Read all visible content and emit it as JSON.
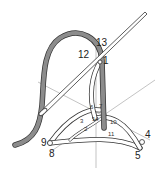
{
  "diagram": {
    "colors": {
      "thread": "#8c8c8c",
      "outline": "#333333",
      "guide_lines": "#9a9a9a",
      "background": "#ffffff"
    },
    "labels": {
      "l1": "1",
      "l2": "2",
      "l3": "3",
      "l4": "4",
      "l5": "5",
      "l6": "6",
      "l7": "7",
      "l8": "8",
      "l9": "9",
      "l10": "10",
      "l11": "11",
      "l12": "12",
      "l13": "13",
      "l14": "14"
    }
  }
}
